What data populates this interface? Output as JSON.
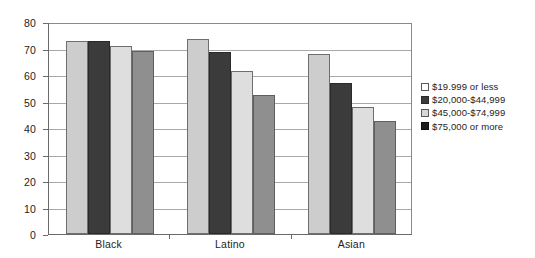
{
  "chart_data": {
    "type": "bar",
    "title": "",
    "subtitle": "",
    "xlabel": "",
    "ylabel": "",
    "categories": [
      "Black",
      "Latino",
      "Asian"
    ],
    "series": [
      {
        "name": "$19.999 or less",
        "values": [
          73,
          73.5,
          68
        ]
      },
      {
        "name": "$20,000-$44,999",
        "values": [
          73,
          68.5,
          57
        ]
      },
      {
        "name": "$45,000-$74,999",
        "values": [
          71,
          61.5,
          48
        ]
      },
      {
        "name": "$75,000 or more",
        "values": [
          69,
          52.5,
          42.5
        ]
      }
    ],
    "ylim": [
      0,
      80
    ],
    "ytick_labels": [
      "0",
      "10",
      "20",
      "30",
      "40",
      "50",
      "60",
      "70",
      "80"
    ],
    "ytick_values": [
      0,
      10,
      20,
      30,
      40,
      50,
      60,
      70,
      80
    ],
    "grid": true,
    "grid_axis": "y",
    "legend_position": "right",
    "series_colors": [
      "#cdcdcd",
      "#3b3b3b",
      "#dedede",
      "#8f8f8f"
    ],
    "legend_swatch_colors": [
      "#ffffff",
      "#3b3b3b",
      "#d6d6d6",
      "#1e1e1e"
    ],
    "axis_color": "#6a6a6a",
    "gridline_color": "#a8a8a8",
    "background_color": "#ffffff"
  },
  "legend": {
    "items": [
      {
        "label": "$19.999 or less"
      },
      {
        "label": "$20,000-$44,999"
      },
      {
        "label": "$45,000-$74,999"
      },
      {
        "label": "$75,000 or more"
      }
    ]
  }
}
